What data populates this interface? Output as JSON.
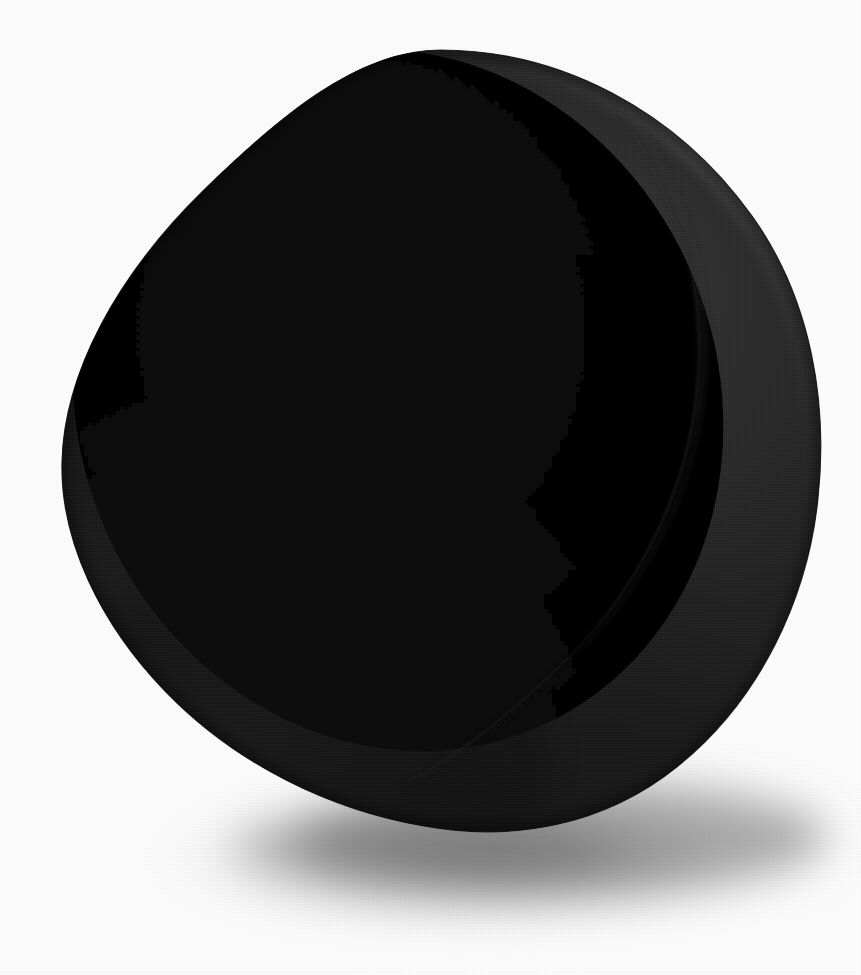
{
  "image": {
    "kind": "photograph",
    "subject": "black-sculptural-object",
    "description": "A matte black fabric-covered egg or teardrop shaped sculptural form, open at the upper left to reveal a deep concave elliptical interior, resting on a plain white surface with a soft cast shadow beneath it.",
    "orientation": "portrait",
    "width": 861,
    "height": 975,
    "background_color": "#ffffff",
    "surface_texture": "fine woven canvas / linen weave",
    "lighting": "soft diffuse light from the upper left",
    "has_text": false,
    "text_content": ""
  },
  "palette": {
    "background": "#ffffff",
    "interior_void": "#040404",
    "interior_deep": "#0a0a0a",
    "shell_dark": "#111111",
    "shell_mid": "#1c1c1c",
    "shell_light": "#2b2b2b",
    "rim_highlight": "#333333",
    "seam_line": "#2e2e2e",
    "shadow_core": "#8f8f8f",
    "shadow_edge": "#f2f2f2"
  },
  "geometry": {
    "silhouette_top": {
      "x": 440,
      "y": 50
    },
    "silhouette_left": {
      "x": 60,
      "y": 590
    },
    "silhouette_right": {
      "x": 820,
      "y": 545
    },
    "silhouette_bottom": {
      "x": 470,
      "y": 828
    },
    "opening_center": {
      "x": 398,
      "y": 400
    },
    "opening_rx": 320,
    "opening_ry": 355,
    "opening_rotation_deg": -22,
    "seam_start": {
      "x": 620,
      "y": 105
    },
    "seam_end": {
      "x": 405,
      "y": 785
    },
    "shadow_center": {
      "x": 470,
      "y": 862
    },
    "shadow_rx": 360,
    "shadow_ry": 78
  },
  "regions": [
    {
      "name": "concave-interior-face",
      "tone": "#050505",
      "note": "large elliptical opening facing upper left, almost pure black, no visible weave"
    },
    {
      "name": "outer-shell-crescent",
      "tone": "#1e1e1e",
      "note": "right and lower-right band of the shell wall, woven texture clearly visible"
    },
    {
      "name": "lower-lip",
      "tone": "#1a1a1a",
      "note": "bottom-left rim curving under the form where it meets the ground"
    },
    {
      "name": "rim-edge-highlight",
      "tone": "#2f2f2f",
      "note": "brightest sliver along the upper-right outer contour"
    },
    {
      "name": "cast-shadow",
      "tone": "#9a9a9a",
      "note": "soft elliptical shadow spreading down and to the right beneath the object"
    }
  ]
}
